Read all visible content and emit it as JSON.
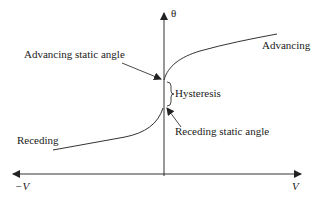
{
  "diagram": {
    "axes": {
      "y_label": "θ",
      "x_pos_label": "V",
      "x_neg_label": "−V"
    },
    "curves": {
      "advancing_label": "Advancing",
      "receding_label": "Receding"
    },
    "annotations": {
      "advancing_static": "Advancing static angle",
      "receding_static": "Receding static angle",
      "hysteresis": "Hysteresis"
    },
    "colors": {
      "line": "#333333",
      "text": "#222222",
      "background": "#ffffff"
    }
  }
}
